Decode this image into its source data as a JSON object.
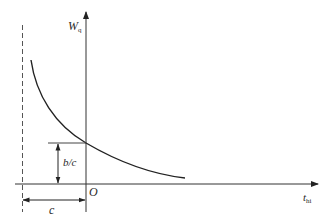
{
  "diagram": {
    "type": "function-curve",
    "y_axis": {
      "label_main": "W",
      "label_sub": "q"
    },
    "x_axis": {
      "label_main": "t",
      "label_sub": "hi"
    },
    "origin_label": "O",
    "asymptote": {
      "style": "dashed",
      "offset_label": "c"
    },
    "intercept": {
      "label": "b/c"
    },
    "curve": {
      "shape": "decreasing hyperbola",
      "color": "#222222"
    },
    "colors": {
      "line": "#333333",
      "background": "#ffffff"
    }
  }
}
